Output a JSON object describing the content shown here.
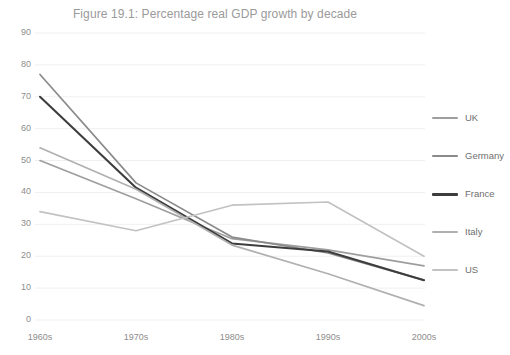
{
  "chart_data": {
    "type": "line",
    "title": "Figure 19.1: Percentage real GDP growth by decade",
    "xlabel": "",
    "ylabel": "",
    "categories": [
      "1960s",
      "1970s",
      "1980s",
      "1990s",
      "2000s"
    ],
    "ylim": [
      0,
      90
    ],
    "ytick_step": 10,
    "yticks": [
      90,
      80,
      70,
      60,
      50,
      40,
      30,
      20,
      10,
      0
    ],
    "grid": true,
    "grid_axis": "y",
    "legend_position": "right",
    "series": [
      {
        "name": "UK",
        "color": "#9e9e9e",
        "values": [
          50,
          38,
          25.5,
          22,
          17
        ]
      },
      {
        "name": "Germany",
        "color": "#8a8a8a",
        "values": [
          77,
          43,
          26,
          21,
          12.5
        ]
      },
      {
        "name": "France",
        "color": "#3d3d3d",
        "values": [
          70,
          41.5,
          24,
          21.5,
          12.5
        ]
      },
      {
        "name": "Italy",
        "color": "#b0b0b0",
        "values": [
          54,
          41,
          23.5,
          14.5,
          4.5
        ]
      },
      {
        "name": "US",
        "color": "#c2c2c2",
        "values": [
          34,
          28,
          36,
          37,
          20
        ]
      }
    ]
  },
  "axis": {
    "y_labels": [
      "90",
      "80",
      "70",
      "60",
      "50",
      "40",
      "30",
      "20",
      "10",
      "0"
    ],
    "x_labels": [
      "1960s",
      "1970s",
      "1980s",
      "1990s",
      "2000s"
    ]
  },
  "legend": {
    "items": [
      {
        "label": "UK"
      },
      {
        "label": "Germany"
      },
      {
        "label": "France"
      },
      {
        "label": "Italy"
      },
      {
        "label": "US"
      }
    ]
  },
  "colors": {
    "background": "#ffffff",
    "grid": "#f0f0f0",
    "tick_text": "#8d8d8d",
    "title_text": "#9a9a9a",
    "legend_text": "#6f6f6f"
  }
}
